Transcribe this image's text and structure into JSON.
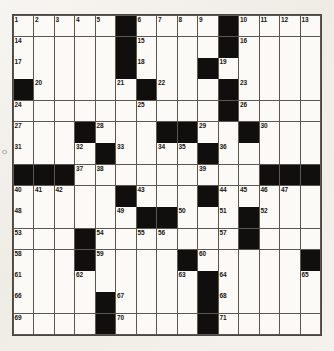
{
  "puzzle": {
    "type": "crossword-grid",
    "title": "",
    "size": {
      "rows": 15,
      "cols": 15
    },
    "margin_note": "0",
    "colors": {
      "paper": "#f4f2ee",
      "cell_fill": "#fbfaf7",
      "block_fill": "#100f0e",
      "grid_line": "#5a5650",
      "number_text": "#17150f"
    },
    "blocks": [
      [
        0,
        5
      ],
      [
        0,
        10
      ],
      [
        1,
        5
      ],
      [
        1,
        10
      ],
      [
        2,
        5
      ],
      [
        2,
        9
      ],
      [
        3,
        0
      ],
      [
        3,
        6
      ],
      [
        3,
        10
      ],
      [
        4,
        10
      ],
      [
        5,
        3
      ],
      [
        5,
        7
      ],
      [
        5,
        8
      ],
      [
        5,
        11
      ],
      [
        6,
        4
      ],
      [
        6,
        9
      ],
      [
        7,
        0
      ],
      [
        7,
        1
      ],
      [
        7,
        2
      ],
      [
        7,
        12
      ],
      [
        7,
        13
      ],
      [
        7,
        14
      ],
      [
        8,
        5
      ],
      [
        8,
        9
      ],
      [
        9,
        6
      ],
      [
        9,
        7
      ],
      [
        9,
        11
      ],
      [
        10,
        3
      ],
      [
        10,
        11
      ],
      [
        11,
        3
      ],
      [
        11,
        8
      ],
      [
        11,
        14
      ],
      [
        12,
        9
      ],
      [
        13,
        4
      ],
      [
        13,
        9
      ],
      [
        14,
        4
      ],
      [
        14,
        9
      ]
    ],
    "numbers": [
      {
        "n": 1,
        "row": 0,
        "col": 0
      },
      {
        "n": 2,
        "row": 0,
        "col": 1
      },
      {
        "n": 3,
        "row": 0,
        "col": 2
      },
      {
        "n": 4,
        "row": 0,
        "col": 3
      },
      {
        "n": 5,
        "row": 0,
        "col": 4
      },
      {
        "n": 6,
        "row": 0,
        "col": 6
      },
      {
        "n": 7,
        "row": 0,
        "col": 7
      },
      {
        "n": 8,
        "row": 0,
        "col": 8
      },
      {
        "n": 9,
        "row": 0,
        "col": 9
      },
      {
        "n": 10,
        "row": 0,
        "col": 11
      },
      {
        "n": 11,
        "row": 0,
        "col": 12
      },
      {
        "n": 12,
        "row": 0,
        "col": 13
      },
      {
        "n": 13,
        "row": 0,
        "col": 14
      },
      {
        "n": 14,
        "row": 1,
        "col": 0
      },
      {
        "n": 15,
        "row": 1,
        "col": 6
      },
      {
        "n": 16,
        "row": 1,
        "col": 11
      },
      {
        "n": 17,
        "row": 2,
        "col": 0
      },
      {
        "n": 18,
        "row": 2,
        "col": 6
      },
      {
        "n": 19,
        "row": 2,
        "col": 10
      },
      {
        "n": 20,
        "row": 3,
        "col": 1
      },
      {
        "n": 21,
        "row": 3,
        "col": 5
      },
      {
        "n": 22,
        "row": 3,
        "col": 7
      },
      {
        "n": 23,
        "row": 3,
        "col": 11
      },
      {
        "n": 24,
        "row": 4,
        "col": 0
      },
      {
        "n": 25,
        "row": 4,
        "col": 6
      },
      {
        "n": 26,
        "row": 4,
        "col": 11
      },
      {
        "n": 27,
        "row": 5,
        "col": 0
      },
      {
        "n": 28,
        "row": 5,
        "col": 4
      },
      {
        "n": 29,
        "row": 5,
        "col": 9
      },
      {
        "n": 30,
        "row": 5,
        "col": 12
      },
      {
        "n": 31,
        "row": 6,
        "col": 0
      },
      {
        "n": 32,
        "row": 6,
        "col": 3
      },
      {
        "n": 33,
        "row": 6,
        "col": 5
      },
      {
        "n": 34,
        "row": 6,
        "col": 7
      },
      {
        "n": 35,
        "row": 6,
        "col": 8
      },
      {
        "n": 36,
        "row": 6,
        "col": 10
      },
      {
        "n": 37,
        "row": 7,
        "col": 3
      },
      {
        "n": 38,
        "row": 7,
        "col": 4
      },
      {
        "n": 39,
        "row": 7,
        "col": 9
      },
      {
        "n": 40,
        "row": 8,
        "col": 0
      },
      {
        "n": 41,
        "row": 8,
        "col": 1
      },
      {
        "n": 42,
        "row": 8,
        "col": 2
      },
      {
        "n": 43,
        "row": 8,
        "col": 6
      },
      {
        "n": 44,
        "row": 8,
        "col": 10
      },
      {
        "n": 45,
        "row": 8,
        "col": 11
      },
      {
        "n": 46,
        "row": 8,
        "col": 12
      },
      {
        "n": 47,
        "row": 8,
        "col": 13
      },
      {
        "n": 48,
        "row": 9,
        "col": 0
      },
      {
        "n": 49,
        "row": 9,
        "col": 5
      },
      {
        "n": 50,
        "row": 9,
        "col": 8
      },
      {
        "n": 51,
        "row": 9,
        "col": 10
      },
      {
        "n": 52,
        "row": 9,
        "col": 12
      },
      {
        "n": 53,
        "row": 10,
        "col": 0
      },
      {
        "n": 54,
        "row": 10,
        "col": 4
      },
      {
        "n": 55,
        "row": 10,
        "col": 6
      },
      {
        "n": 56,
        "row": 10,
        "col": 7
      },
      {
        "n": 57,
        "row": 10,
        "col": 10
      },
      {
        "n": 58,
        "row": 11,
        "col": 0
      },
      {
        "n": 59,
        "row": 11,
        "col": 4
      },
      {
        "n": 60,
        "row": 11,
        "col": 9
      },
      {
        "n": 61,
        "row": 12,
        "col": 0
      },
      {
        "n": 62,
        "row": 12,
        "col": 3
      },
      {
        "n": 63,
        "row": 12,
        "col": 8
      },
      {
        "n": 64,
        "row": 12,
        "col": 10
      },
      {
        "n": 65,
        "row": 12,
        "col": 14
      },
      {
        "n": 66,
        "row": 13,
        "col": 0
      },
      {
        "n": 67,
        "row": 13,
        "col": 5
      },
      {
        "n": 68,
        "row": 13,
        "col": 10
      },
      {
        "n": 69,
        "row": 14,
        "col": 0
      },
      {
        "n": 70,
        "row": 14,
        "col": 5
      },
      {
        "n": 71,
        "row": 14,
        "col": 10
      }
    ],
    "letters": []
  }
}
